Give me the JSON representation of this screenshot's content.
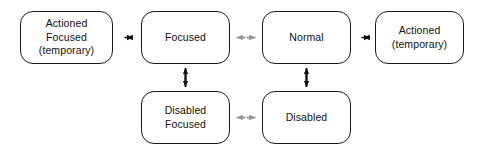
{
  "diagram": {
    "type": "state-transition-diagram",
    "background_color": "#ffffff",
    "nodes": [
      {
        "id": "actioned-focused",
        "lines": [
          "Actioned",
          "Focused",
          "(temporary)"
        ],
        "row": "top",
        "column": 1
      },
      {
        "id": "focused",
        "lines": [
          "Focused"
        ],
        "row": "top",
        "column": 2
      },
      {
        "id": "normal",
        "lines": [
          "Normal"
        ],
        "row": "top",
        "column": 3
      },
      {
        "id": "actioned",
        "lines": [
          "Actioned",
          "(temporary)"
        ],
        "row": "top",
        "column": 4
      },
      {
        "id": "disabled-focused",
        "lines": [
          "Disabled",
          "Focused"
        ],
        "row": "bottom",
        "column": 2
      },
      {
        "id": "disabled",
        "lines": [
          "Disabled"
        ],
        "row": "bottom",
        "column": 3
      }
    ],
    "edges": [
      {
        "id": "edge-actioned-focused-focused",
        "from": "actioned-focused",
        "to": "focused",
        "style": "dashed",
        "color": "#111111",
        "direction": "bidirectional",
        "orientation": "horizontal"
      },
      {
        "id": "edge-focused-normal",
        "from": "focused",
        "to": "normal",
        "style": "solid",
        "color": "#959595",
        "direction": "bidirectional",
        "orientation": "horizontal"
      },
      {
        "id": "edge-normal-actioned",
        "from": "normal",
        "to": "actioned",
        "style": "dashed",
        "color": "#111111",
        "direction": "bidirectional",
        "orientation": "horizontal"
      },
      {
        "id": "edge-focused-disabled-focused",
        "from": "focused",
        "to": "disabled-focused",
        "style": "solid",
        "color": "#111111",
        "direction": "bidirectional",
        "orientation": "vertical"
      },
      {
        "id": "edge-normal-disabled",
        "from": "normal",
        "to": "disabled",
        "style": "solid",
        "color": "#111111",
        "direction": "bidirectional",
        "orientation": "vertical"
      },
      {
        "id": "edge-disabled-focused-disabled",
        "from": "disabled-focused",
        "to": "disabled",
        "style": "solid",
        "color": "#959595",
        "direction": "bidirectional",
        "orientation": "horizontal"
      }
    ]
  }
}
